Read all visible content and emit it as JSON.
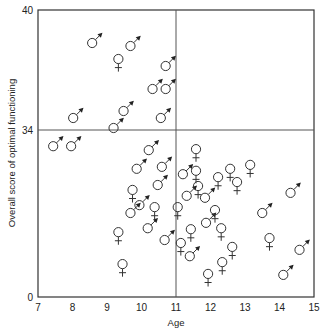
{
  "chart_data": {
    "type": "scatter",
    "title": "",
    "xlabel": "Age",
    "ylabel": "Overall score of optimal functioning",
    "xlim": [
      7,
      15
    ],
    "ylim": [
      0,
      40
    ],
    "x_ticks": [
      "7",
      "8",
      "9",
      "10",
      "11",
      "12",
      "13",
      "14",
      "15"
    ],
    "y_ticks": [
      "0",
      "34",
      "40"
    ],
    "y_scale_note": "non-linear: band 34-40 expanded",
    "reference_lines": {
      "vertical_x": 11,
      "horizontal_y": 34
    },
    "grid": false,
    "legend": "none",
    "series": [
      {
        "name": "male",
        "marker": "male-symbol",
        "points": [
          [
            8.57,
            38.35
          ],
          [
            9.68,
            38.2
          ],
          [
            10.7,
            37.2
          ],
          [
            10.32,
            36.05
          ],
          [
            10.7,
            36.05
          ],
          [
            8.02,
            34.6
          ],
          [
            9.48,
            34.95
          ],
          [
            10.56,
            34.6
          ],
          [
            9.19,
            34.1
          ],
          [
            7.44,
            30.7
          ],
          [
            7.96,
            30.7
          ],
          [
            10.21,
            29.9
          ],
          [
            10.59,
            26.5
          ],
          [
            9.86,
            26.1
          ],
          [
            10.47,
            22.8
          ],
          [
            9.94,
            18.7
          ],
          [
            9.68,
            17.1
          ],
          [
            10.18,
            14.0
          ],
          [
            10.67,
            11.6
          ],
          [
            11.2,
            25.0
          ],
          [
            11.31,
            20.6
          ],
          [
            11.84,
            20.2
          ],
          [
            11.87,
            15.1
          ],
          [
            11.4,
            8.3
          ],
          [
            14.32,
            21.2
          ],
          [
            13.5,
            17.1
          ],
          [
            14.58,
            9.6
          ],
          [
            14.11,
            4.5
          ]
        ]
      },
      {
        "name": "female",
        "marker": "female-symbol",
        "points": [
          [
            9.33,
            37.55
          ],
          [
            9.74,
            21.8
          ],
          [
            10.38,
            18.3
          ],
          [
            9.33,
            13.2
          ],
          [
            9.45,
            6.7
          ],
          [
            11.58,
            30.1
          ],
          [
            11.58,
            25.7
          ],
          [
            12.57,
            26.1
          ],
          [
            13.15,
            26.9
          ],
          [
            11.64,
            22.6
          ],
          [
            12.22,
            24.4
          ],
          [
            12.77,
            23.4
          ],
          [
            11.05,
            18.3
          ],
          [
            12.13,
            17.7
          ],
          [
            11.43,
            13.8
          ],
          [
            12.31,
            14.0
          ],
          [
            11.14,
            11.0
          ],
          [
            12.63,
            10.2
          ],
          [
            12.34,
            7.1
          ],
          [
            11.93,
            4.7
          ],
          [
            13.71,
            12.0
          ]
        ]
      }
    ]
  }
}
